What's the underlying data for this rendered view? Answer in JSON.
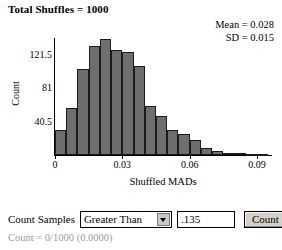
{
  "header": {
    "title": "Total Shuffles = 1000"
  },
  "stats": {
    "mean": "Mean = 0.028",
    "sd": "SD = 0.015"
  },
  "chart_data": {
    "type": "bar",
    "title": "Total Shuffles = 1000",
    "xlabel": "Shuffled MADs",
    "ylabel": "Count",
    "xlim": [
      0,
      0.097
    ],
    "ylim": [
      0,
      148.5
    ],
    "grid": false,
    "legend": null,
    "bin_width": 0.005,
    "xticks": [
      {
        "value": 0,
        "label": "0"
      },
      {
        "value": 0.03,
        "label": "0.03"
      },
      {
        "value": 0.06,
        "label": "0.06"
      },
      {
        "value": 0.09,
        "label": "0.09"
      }
    ],
    "yticks": [
      {
        "value": 40.5,
        "label": "40.5"
      },
      {
        "value": 81,
        "label": "81"
      },
      {
        "value": 121.5,
        "label": "121.5"
      }
    ],
    "bin_starts": [
      0.0,
      0.005,
      0.01,
      0.015,
      0.02,
      0.025,
      0.03,
      0.035,
      0.04,
      0.045,
      0.05,
      0.055,
      0.06,
      0.065,
      0.07,
      0.075,
      0.08,
      0.085,
      0.09
    ],
    "categories": [
      "0.000",
      "0.005",
      "0.010",
      "0.015",
      "0.020",
      "0.025",
      "0.030",
      "0.035",
      "0.040",
      "0.045",
      "0.050",
      "0.055",
      "0.060",
      "0.065",
      "0.070",
      "0.075",
      "0.080",
      "0.085",
      "0.090"
    ],
    "values": [
      30,
      57,
      105,
      133,
      141,
      128,
      125,
      108,
      60,
      47,
      30,
      25,
      18,
      8,
      5,
      3,
      2,
      1,
      1
    ],
    "annotations": [
      "Mean = 0.028",
      "SD = 0.015"
    ],
    "bar_color": "#6e6e6e",
    "bar_border_color": "#1a1a1a"
  },
  "controls": {
    "label": "Count Samples",
    "comparison_selected": "Greater Than",
    "comparison_options": [
      "Greater Than"
    ],
    "threshold_value": ".135",
    "threshold_placeholder": "",
    "count_button": "Count"
  },
  "result": {
    "text": "Count = 0/1000 (0.0000)"
  }
}
